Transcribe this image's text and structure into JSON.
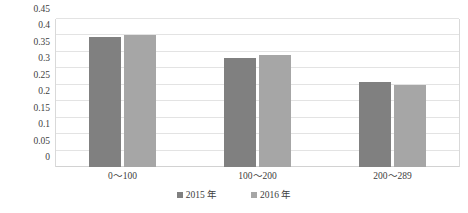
{
  "chart_data": {
    "type": "bar",
    "title": "",
    "subtitle": "",
    "xlabel": "",
    "ylabel": "",
    "categories": [
      "0～100",
      "100～200",
      "200～289"
    ],
    "series": [
      {
        "name": "2015 年",
        "color": "#808080",
        "values": [
          0.395,
          0.33,
          0.26
        ]
      },
      {
        "name": "2016 年",
        "color": "#a6a6a6",
        "values": [
          0.4,
          0.34,
          0.25
        ]
      }
    ],
    "ylim": [
      0,
      0.45
    ],
    "ytick_values": [
      0,
      0.05,
      0.1,
      0.15,
      0.2,
      0.25,
      0.3,
      0.35,
      0.4,
      0.45
    ],
    "ytick_labels": [
      "0",
      "0.05",
      "0.1",
      "0.15",
      "0.2",
      "0.25",
      "0.3",
      "0.35",
      "0.4",
      "0.45"
    ],
    "grid": true,
    "grid_axis": "y",
    "legend": true,
    "legend_position": "bottom",
    "annotations": []
  },
  "colors": {
    "series_2015": "#808080",
    "series_2016": "#a6a6a6",
    "gridline": "#e3e3e3",
    "baseline": "#d2d2d2",
    "text": "#3d3d3d",
    "background": "#ffffff"
  }
}
